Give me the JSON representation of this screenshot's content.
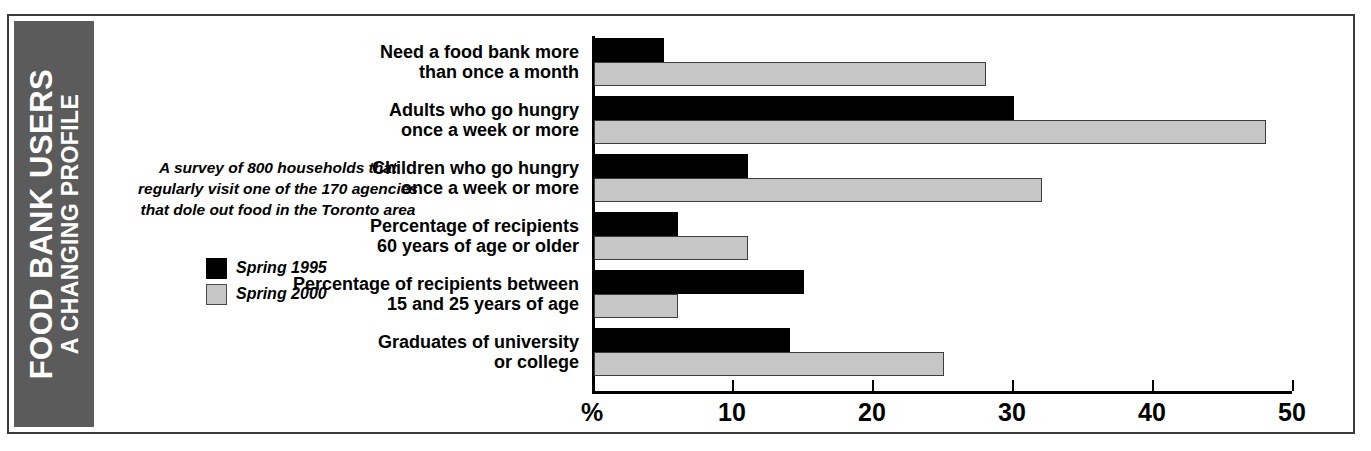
{
  "title": {
    "main": "FOOD BANK USERS",
    "sub": "A CHANGING PROFILE",
    "band_color": "#5b5b5b"
  },
  "blurb": "A survey of 800 households that regularly visit one of the 170 agencies that dole out food in the Toronto area",
  "legend": [
    {
      "label": "Spring 1995",
      "swatch": "black",
      "color": "#000000"
    },
    {
      "label": "Spring 2000",
      "swatch": "gray",
      "color": "#c6c6c6"
    }
  ],
  "chart_data": {
    "type": "bar",
    "orientation": "horizontal",
    "subtitle": "A survey of 800 households that regularly visit one of the 170 agencies that dole out food in the Toronto area",
    "xlabel": "%",
    "ylabel": "",
    "xlim": [
      0,
      50
    ],
    "xticks": [
      0,
      10,
      20,
      30,
      40,
      50
    ],
    "xticklabels": [
      "%",
      "10",
      "20",
      "30",
      "40",
      "50"
    ],
    "grid": false,
    "legend_position": "left",
    "categories": [
      "Need a food bank more\nthan once a month",
      "Adults who go hungry\nonce a week or more",
      "Children who go hungry\nonce a week or more",
      "Percentage of recipients\n60 years of age or older",
      "Percentage of recipients between\n15 and 25 years of age",
      "Graduates of university\nor college"
    ],
    "series": [
      {
        "name": "Spring 1995",
        "color": "#000000",
        "values": [
          5,
          30,
          11,
          6,
          15,
          14
        ]
      },
      {
        "name": "Spring 2000",
        "color": "#c6c6c6",
        "values": [
          28,
          48,
          32,
          11,
          6,
          25
        ]
      }
    ]
  }
}
